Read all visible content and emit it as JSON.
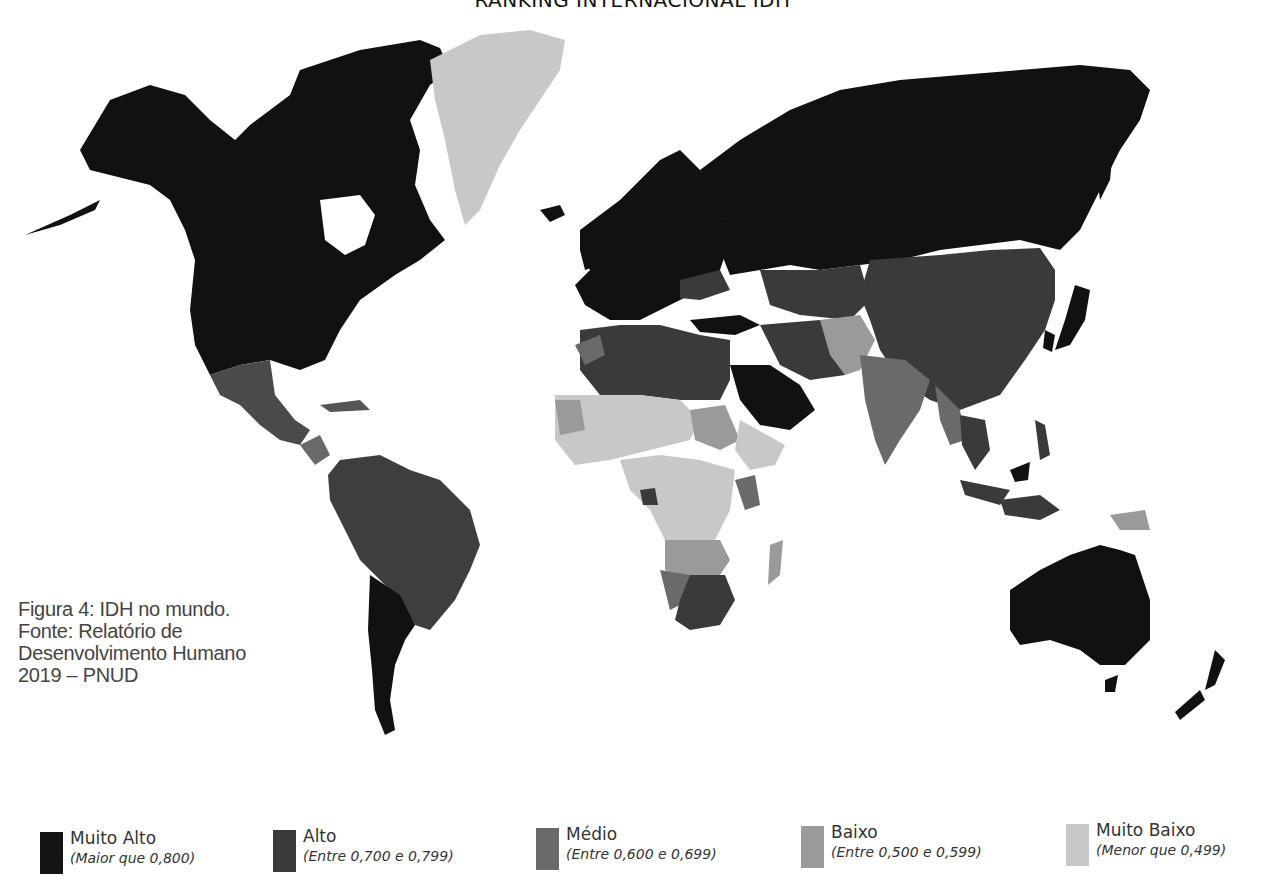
{
  "title": "RANKING INTERNACIONAL IDH",
  "caption": {
    "lines": [
      "Figura 4: IDH no mundo.",
      "Fonte: Relatório de",
      "Desenvolvimento Humano",
      "2019 – PNUD"
    ]
  },
  "legend": {
    "items": [
      {
        "label": "Muito Alto",
        "range": "(Maior que 0,800)",
        "color": "#141414"
      },
      {
        "label": "Alto",
        "range": "(Entre 0,700 e 0,799)",
        "color": "#3a3a3a"
      },
      {
        "label": "Médio",
        "range": "(Entre 0,600 e 0,699)",
        "color": "#6a6a6a"
      },
      {
        "label": "Baixo",
        "range": "(Entre 0,500 e 0,599)",
        "color": "#9a9a9a"
      },
      {
        "label": "Muito Baixo",
        "range": "(Menor que 0,499)",
        "color": "#c8c8c8"
      }
    ]
  },
  "regions": {
    "muito_alto": [
      "North America (USA, Canada)",
      "Europe",
      "Russia",
      "Australia",
      "New Zealand",
      "Japan",
      "South Korea",
      "Saudi Arabia",
      "Argentina",
      "Chile",
      "Turkey"
    ],
    "alto": [
      "Mexico",
      "Brazil",
      "South America (north)",
      "China",
      "Iran",
      "Algeria",
      "Libya",
      "Egypt",
      "Ukraine",
      "Kazakhstan",
      "South Africa",
      "Botswana",
      "Gabon",
      "Thailand",
      "Malaysia/Indonesia"
    ],
    "medio": [
      "India",
      "Morocco",
      "Namibia",
      "Central America",
      "Kenya",
      "Ghana",
      "Indonesia"
    ],
    "baixo": [
      "Sub-Saharan Africa (various)",
      "Pakistan",
      "Myanmar",
      "Madagascar",
      "Sudan",
      "Papua New Guinea"
    ],
    "muito_baixo": [
      "Greenland (rendered light)",
      "Sahel countries",
      "Central Africa",
      "Afghanistan"
    ]
  }
}
